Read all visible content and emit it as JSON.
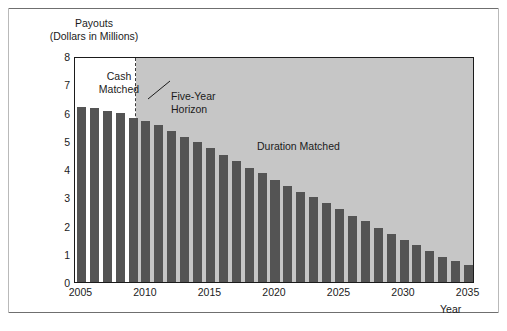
{
  "figure": {
    "y_axis_title_line1": "Payouts",
    "y_axis_title_line2": "(Dollars in Millions)",
    "x_axis_title": "Year"
  },
  "annotations": {
    "cash_matched": "Cash\nMatched",
    "five_year_horizon": "Five-Year\nHorizon",
    "duration_matched": "Duration Matched"
  },
  "colors": {
    "bar": "#545454",
    "shaded_region": "#c6c6c6",
    "plot_background": "#ffffff",
    "axis": "#1b1b1b",
    "horizon_dashes": "#3a3a3a"
  },
  "chart_data": {
    "type": "bar",
    "title": "",
    "subtitle": "",
    "xlabel": "Year",
    "ylabel": "Payouts (Dollars in Millions)",
    "xlim": [
      2004.5,
      2035.5
    ],
    "ylim": [
      0,
      8
    ],
    "grid": false,
    "legend_position": "none",
    "ytick_labels": [
      "0",
      "1",
      "2",
      "3",
      "4",
      "5",
      "6",
      "7",
      "8"
    ],
    "ytick_values": [
      0,
      1,
      2,
      3,
      4,
      5,
      6,
      7,
      8
    ],
    "xtick_labels": [
      "2005",
      "2010",
      "2015",
      "2020",
      "2025",
      "2030",
      "2035"
    ],
    "xtick_values": [
      2005,
      2010,
      2015,
      2020,
      2025,
      2030,
      2035
    ],
    "categories": [
      2005,
      2006,
      2007,
      2008,
      2009,
      2010,
      2011,
      2012,
      2013,
      2014,
      2015,
      2016,
      2017,
      2018,
      2019,
      2020,
      2021,
      2022,
      2023,
      2024,
      2025,
      2026,
      2027,
      2028,
      2029,
      2030,
      2031,
      2032,
      2033,
      2034,
      2035
    ],
    "values": [
      6.2,
      6.15,
      6.05,
      6.0,
      5.8,
      5.7,
      5.55,
      5.35,
      5.15,
      4.95,
      4.75,
      4.5,
      4.3,
      4.05,
      3.85,
      3.6,
      3.4,
      3.2,
      3.0,
      2.8,
      2.6,
      2.35,
      2.15,
      1.9,
      1.7,
      1.5,
      1.3,
      1.1,
      0.9,
      0.75,
      0.6
    ],
    "regions": [
      {
        "name": "Cash Matched",
        "x_start": 2004.5,
        "x_end": 2009.2,
        "shaded": false
      },
      {
        "name": "Duration Matched",
        "x_start": 2009.2,
        "x_end": 2035.5,
        "shaded": true
      }
    ],
    "markers": [
      {
        "name": "Five-Year Horizon",
        "type": "vertical-dashed-line",
        "x": 2009.2
      }
    ]
  }
}
